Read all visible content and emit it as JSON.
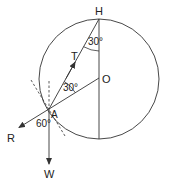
{
  "diagram": {
    "points": {
      "H": "H",
      "O": "O",
      "A": "A"
    },
    "forces": {
      "tension": "T",
      "reaction": "R",
      "weight": "W"
    },
    "angles": {
      "at_H": "30°",
      "at_A_between_T_and_R_line": "30°",
      "between_R_and_W": "60°"
    },
    "colors": {
      "stroke": "#333333",
      "background": "#ffffff"
    }
  }
}
